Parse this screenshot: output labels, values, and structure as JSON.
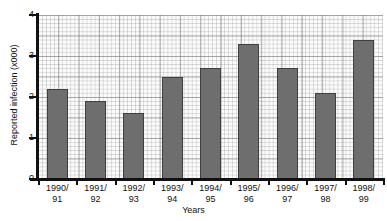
{
  "chart_data": {
    "type": "bar",
    "title": "",
    "subtitle": "",
    "xlabel": "Years",
    "ylabel": "Reported infection (x000)",
    "categories": [
      "1990/ 91",
      "1991/ 92",
      "1992/ 93",
      "1993/ 94",
      "1994/ 95",
      "1995/ 96",
      "1996/ 97",
      "1997/ 98",
      "1998/ 99"
    ],
    "category_lines": [
      [
        "1990/",
        "91"
      ],
      [
        "1991/",
        "92"
      ],
      [
        "1992/",
        "93"
      ],
      [
        "1993/",
        "94"
      ],
      [
        "1994/",
        "95"
      ],
      [
        "1995/",
        "96"
      ],
      [
        "1996/",
        "97"
      ],
      [
        "1997/",
        "98"
      ],
      [
        "1998/",
        "99"
      ]
    ],
    "values": [
      2.2,
      1.9,
      1.6,
      2.5,
      2.7,
      3.3,
      2.7,
      2.1,
      3.4
    ],
    "ylim": [
      0,
      4
    ],
    "yticks": [
      0,
      1,
      2,
      3,
      4
    ],
    "ytick_labels": [
      "0",
      "1",
      "2",
      "3",
      "4"
    ],
    "grid": true,
    "grid_style": "graph-paper",
    "legend": false,
    "legend_position": "none",
    "bar_color": "#6e6e6e",
    "bar_edge_color": "#3f3f3f",
    "axis_color": "#111111",
    "plot_background": "#fbfbfb",
    "page_background": "#ffffff"
  }
}
